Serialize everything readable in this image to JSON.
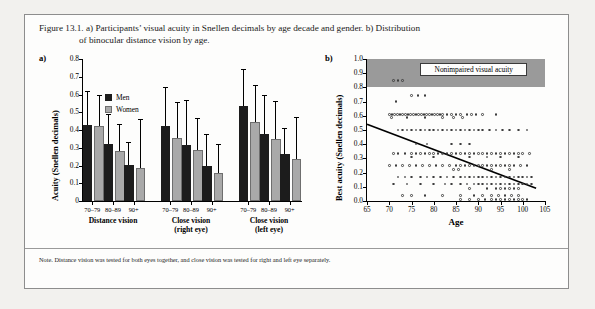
{
  "caption": {
    "line1": "Figure 13.1. a) Participants’ visual acuity in Snellen decimals by age decade and gender. b) Distribution",
    "line2": "of binocular distance vision by age."
  },
  "note": "Note. Distance vision was tested for both eyes together, and close vision was tested for right and left eye separately.",
  "panel_a": {
    "tag": "a)",
    "legend": [
      {
        "label": "Men",
        "color": "#1c1c1c"
      },
      {
        "label": "Women",
        "color": "#a9a9a9"
      }
    ]
  },
  "panel_b": {
    "tag": "b)",
    "band_label": "Nonimpaired visual acuity"
  },
  "chart_data": [
    {
      "type": "bar",
      "panel": "a",
      "title": "",
      "xlabel": "",
      "ylabel": "Acuity (Snellen decimals)",
      "ylim": [
        0,
        0.8
      ],
      "yticks": [
        0,
        0.1,
        0.2,
        0.3,
        0.4,
        0.5,
        0.6,
        0.7,
        0.8
      ],
      "ytick_labels": [
        "0",
        "0.1",
        "0.2",
        "0.3",
        "0.4",
        "0.5",
        "0.6",
        "0.7",
        "0.8"
      ],
      "grid": false,
      "legend": [
        "Men",
        "Women"
      ],
      "legend_position": "top-left",
      "groups": [
        {
          "label": "Distance vision",
          "sublabel": "",
          "categories": [
            "70–79",
            "80–89",
            "90+"
          ],
          "series": [
            {
              "name": "Men",
              "color": "#1c1c1c",
              "values": [
                0.43,
                0.32,
                0.205
              ],
              "errors_upper": [
                0.62,
                0.49,
                0.335
              ]
            },
            {
              "name": "Women",
              "color": "#a9a9a9",
              "values": [
                0.42,
                0.28,
                0.185
              ],
              "errors_upper": [
                0.6,
                0.435,
                0.46
              ]
            }
          ]
        },
        {
          "label": "Close vision",
          "sublabel": "(right eye)",
          "categories": [
            "70–79",
            "80–89",
            "90+"
          ],
          "series": [
            {
              "name": "Men",
              "color": "#1c1c1c",
              "values": [
                0.42,
                0.315,
                0.2
              ],
              "errors_upper": [
                0.645,
                0.57,
                0.375
              ]
            },
            {
              "name": "Women",
              "color": "#a9a9a9",
              "values": [
                0.355,
                0.285,
                0.16
              ],
              "errors_upper": [
                0.555,
                0.465,
                0.32
              ]
            }
          ]
        },
        {
          "label": "Close vision",
          "sublabel": "(left eye)",
          "categories": [
            "70–79",
            "80–89",
            "90+"
          ],
          "series": [
            {
              "name": "Men",
              "color": "#1c1c1c",
              "values": [
                0.535,
                0.375,
                0.265
              ],
              "errors_upper": [
                0.745,
                0.6,
                0.41
              ]
            },
            {
              "name": "Women",
              "color": "#a9a9a9",
              "values": [
                0.445,
                0.35,
                0.235
              ],
              "errors_upper": [
                0.655,
                0.565,
                0.475
              ]
            }
          ]
        }
      ]
    },
    {
      "type": "scatter",
      "panel": "b",
      "title": "",
      "xlabel": "Age",
      "ylabel": "Best acuity (Snellen decimals)",
      "xlim": [
        65,
        105
      ],
      "ylim": [
        0.0,
        1.0
      ],
      "xticks": [
        65,
        70,
        75,
        80,
        85,
        90,
        95,
        100,
        105
      ],
      "xtick_labels": [
        "65",
        "70",
        "75",
        "80",
        "85",
        "90",
        "95",
        "100",
        "105"
      ],
      "yticks": [
        0.0,
        0.1,
        0.2,
        0.3,
        0.4,
        0.5,
        0.6,
        0.7,
        0.8,
        0.9,
        1.0
      ],
      "ytick_labels": [
        "0.0",
        "0.1",
        "0.2",
        "0.3",
        "0.4",
        "0.5",
        "0.6",
        "0.7",
        "0.8",
        "0.9",
        "1.0"
      ],
      "grid": false,
      "marker": "open-circle",
      "shaded_region": {
        "label": "Nonimpaired visual acuity",
        "y_from": 0.8,
        "y_to": 1.0,
        "color": "#9a9a9a"
      },
      "trendline": {
        "x": [
          65,
          103
        ],
        "y": [
          0.54,
          0.09
        ],
        "color": "#000000"
      },
      "points": [
        [
          71,
          0.85
        ],
        [
          72,
          0.85
        ],
        [
          73,
          0.85
        ],
        [
          71.5,
          0.7
        ],
        [
          75,
          0.745
        ],
        [
          76.5,
          0.745
        ],
        [
          78,
          0.745
        ],
        [
          70,
          0.61
        ],
        [
          70.6,
          0.61
        ],
        [
          71.2,
          0.61
        ],
        [
          71.8,
          0.61
        ],
        [
          72.4,
          0.61
        ],
        [
          73,
          0.61
        ],
        [
          73.6,
          0.61
        ],
        [
          74.2,
          0.61
        ],
        [
          74.8,
          0.61
        ],
        [
          75.4,
          0.61
        ],
        [
          76,
          0.61
        ],
        [
          76.6,
          0.61
        ],
        [
          77.2,
          0.61
        ],
        [
          77.8,
          0.61
        ],
        [
          78.4,
          0.61
        ],
        [
          79,
          0.61
        ],
        [
          79.6,
          0.61
        ],
        [
          80.2,
          0.61
        ],
        [
          80.8,
          0.61
        ],
        [
          81.4,
          0.61
        ],
        [
          82,
          0.61
        ],
        [
          83,
          0.61
        ],
        [
          84,
          0.61
        ],
        [
          85,
          0.61
        ],
        [
          86,
          0.61
        ],
        [
          87.5,
          0.61
        ],
        [
          88.5,
          0.61
        ],
        [
          89.5,
          0.61
        ],
        [
          91,
          0.61
        ],
        [
          94,
          0.61
        ],
        [
          70.5,
          0.59
        ],
        [
          74,
          0.59
        ],
        [
          78,
          0.59
        ],
        [
          82,
          0.59
        ],
        [
          84.5,
          0.59
        ],
        [
          86.5,
          0.59
        ],
        [
          72,
          0.5
        ],
        [
          73,
          0.5
        ],
        [
          74,
          0.5
        ],
        [
          75,
          0.5
        ],
        [
          76,
          0.5
        ],
        [
          77,
          0.5
        ],
        [
          78,
          0.5
        ],
        [
          79,
          0.5
        ],
        [
          80,
          0.5
        ],
        [
          81,
          0.5
        ],
        [
          82,
          0.5
        ],
        [
          83,
          0.5
        ],
        [
          84,
          0.5
        ],
        [
          85,
          0.5
        ],
        [
          86,
          0.5
        ],
        [
          87,
          0.5
        ],
        [
          88,
          0.5
        ],
        [
          89,
          0.5
        ],
        [
          90,
          0.5
        ],
        [
          91,
          0.5
        ],
        [
          92.5,
          0.5
        ],
        [
          94,
          0.5
        ],
        [
          95.5,
          0.5
        ],
        [
          97,
          0.5
        ],
        [
          99,
          0.5
        ],
        [
          101,
          0.5
        ],
        [
          76,
          0.4
        ],
        [
          78.5,
          0.4
        ],
        [
          84,
          0.4
        ],
        [
          86,
          0.4
        ],
        [
          88,
          0.4
        ],
        [
          71,
          0.335
        ],
        [
          72,
          0.335
        ],
        [
          73.5,
          0.335
        ],
        [
          75,
          0.335
        ],
        [
          76,
          0.335
        ],
        [
          77,
          0.335
        ],
        [
          78,
          0.335
        ],
        [
          79,
          0.335
        ],
        [
          80,
          0.335
        ],
        [
          81,
          0.335
        ],
        [
          82,
          0.335
        ],
        [
          83,
          0.335
        ],
        [
          84,
          0.335
        ],
        [
          85,
          0.335
        ],
        [
          86,
          0.335
        ],
        [
          87,
          0.335
        ],
        [
          88,
          0.335
        ],
        [
          89,
          0.335
        ],
        [
          90,
          0.335
        ],
        [
          91,
          0.335
        ],
        [
          92,
          0.335
        ],
        [
          93,
          0.335
        ],
        [
          94,
          0.335
        ],
        [
          95,
          0.335
        ],
        [
          96,
          0.335
        ],
        [
          97,
          0.335
        ],
        [
          98,
          0.335
        ],
        [
          99,
          0.335
        ],
        [
          100,
          0.335
        ],
        [
          101.5,
          0.335
        ],
        [
          75,
          0.31
        ],
        [
          80,
          0.31
        ],
        [
          88,
          0.31
        ],
        [
          92,
          0.31
        ],
        [
          95,
          0.31
        ],
        [
          99,
          0.31
        ],
        [
          70,
          0.25
        ],
        [
          71.5,
          0.25
        ],
        [
          73,
          0.25
        ],
        [
          74.5,
          0.25
        ],
        [
          76,
          0.25
        ],
        [
          77.5,
          0.25
        ],
        [
          79,
          0.25
        ],
        [
          80.5,
          0.25
        ],
        [
          82,
          0.25
        ],
        [
          83.5,
          0.25
        ],
        [
          85,
          0.25
        ],
        [
          86,
          0.25
        ],
        [
          87,
          0.25
        ],
        [
          88,
          0.25
        ],
        [
          89,
          0.25
        ],
        [
          90,
          0.25
        ],
        [
          91,
          0.25
        ],
        [
          92,
          0.25
        ],
        [
          93,
          0.25
        ],
        [
          94,
          0.25
        ],
        [
          95,
          0.25
        ],
        [
          96,
          0.25
        ],
        [
          97,
          0.25
        ],
        [
          98,
          0.25
        ],
        [
          99.5,
          0.25
        ],
        [
          101,
          0.25
        ],
        [
          84.5,
          0.22
        ],
        [
          85.5,
          0.22
        ],
        [
          93,
          0.22
        ],
        [
          97,
          0.22
        ],
        [
          72,
          0.17
        ],
        [
          73.5,
          0.17
        ],
        [
          75,
          0.17
        ],
        [
          77,
          0.17
        ],
        [
          78.5,
          0.17
        ],
        [
          80,
          0.17
        ],
        [
          81.5,
          0.17
        ],
        [
          83,
          0.17
        ],
        [
          84.5,
          0.17
        ],
        [
          86,
          0.17
        ],
        [
          87,
          0.17
        ],
        [
          88,
          0.17
        ],
        [
          89,
          0.17
        ],
        [
          90,
          0.17
        ],
        [
          91,
          0.17
        ],
        [
          92,
          0.17
        ],
        [
          93,
          0.17
        ],
        [
          94,
          0.17
        ],
        [
          95,
          0.17
        ],
        [
          96,
          0.17
        ],
        [
          97,
          0.17
        ],
        [
          98,
          0.17
        ],
        [
          99,
          0.17
        ],
        [
          100,
          0.17
        ],
        [
          101,
          0.17
        ],
        [
          102,
          0.17
        ],
        [
          71,
          0.12
        ],
        [
          74,
          0.12
        ],
        [
          77,
          0.12
        ],
        [
          80,
          0.12
        ],
        [
          82.5,
          0.12
        ],
        [
          84,
          0.12
        ],
        [
          86,
          0.12
        ],
        [
          87.5,
          0.12
        ],
        [
          89,
          0.12
        ],
        [
          90,
          0.12
        ],
        [
          91,
          0.12
        ],
        [
          92,
          0.12
        ],
        [
          93,
          0.12
        ],
        [
          94,
          0.12
        ],
        [
          95,
          0.12
        ],
        [
          96,
          0.12
        ],
        [
          97,
          0.12
        ],
        [
          98,
          0.12
        ],
        [
          99,
          0.12
        ],
        [
          100,
          0.12
        ],
        [
          101,
          0.12
        ],
        [
          102,
          0.12
        ],
        [
          88,
          0.09
        ],
        [
          92,
          0.09
        ],
        [
          94,
          0.09
        ],
        [
          95,
          0.09
        ],
        [
          96,
          0.09
        ],
        [
          97,
          0.09
        ],
        [
          98,
          0.09
        ],
        [
          99,
          0.09
        ],
        [
          73,
          0.04
        ],
        [
          75,
          0.04
        ],
        [
          78,
          0.04
        ],
        [
          82,
          0.04
        ],
        [
          86,
          0.04
        ],
        [
          89,
          0.04
        ],
        [
          91,
          0.04
        ],
        [
          93,
          0.04
        ],
        [
          94.5,
          0.04
        ],
        [
          96,
          0.04
        ],
        [
          97.5,
          0.04
        ],
        [
          99,
          0.04
        ],
        [
          86,
          0.01
        ],
        [
          88,
          0.01
        ],
        [
          90,
          0.01
        ],
        [
          91.5,
          0.01
        ],
        [
          93,
          0.01
        ],
        [
          94,
          0.01
        ],
        [
          95,
          0.01
        ],
        [
          96,
          0.01
        ],
        [
          97,
          0.01
        ],
        [
          98,
          0.01
        ],
        [
          99,
          0.01
        ],
        [
          100,
          0.01
        ],
        [
          101,
          0.01
        ]
      ]
    }
  ]
}
